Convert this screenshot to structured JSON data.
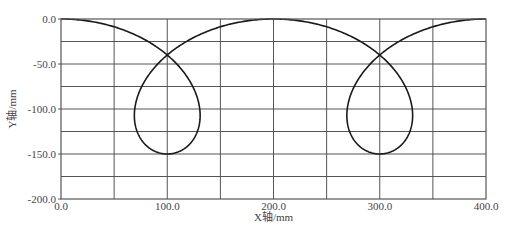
{
  "chart_data": {
    "type": "line",
    "title": "",
    "xlabel": "X轴/mm",
    "ylabel": "Y轴/mm",
    "xlim": [
      0,
      400
    ],
    "ylim": [
      -200,
      0
    ],
    "grid": true,
    "legend": null,
    "x_ticks": [
      0,
      100,
      200,
      300,
      400
    ],
    "x_tick_labels": [
      "0.0",
      "100.0",
      "200.0",
      "300.0",
      "400.0"
    ],
    "x_minor_grid_step": 50,
    "y_ticks": [
      0,
      -50,
      -100,
      -150,
      -200
    ],
    "y_tick_labels": [
      "0.0",
      "-50.0",
      "-100.0",
      "-150.0",
      "-200.0"
    ],
    "y_minor_grid_step": 25,
    "curve_model": {
      "description": "prolate trochoid with two loops",
      "x": "R*t + d*sin(t)",
      "y": "-A*(1 - cos(t))",
      "R": 31.83,
      "d": 74,
      "A": 75,
      "t_range": [
        0,
        12.566
      ]
    },
    "series": [
      {
        "name": "trajectory",
        "color": "#1a1a1a",
        "points": [
          [
            0,
            0
          ],
          [
            50,
            -8.7
          ],
          [
            100,
            -40
          ],
          [
            124,
            -75
          ],
          [
            131,
            -104
          ],
          [
            124,
            -135
          ],
          [
            100,
            -150
          ],
          [
            76,
            -135
          ],
          [
            69,
            -104
          ],
          [
            76,
            -75
          ],
          [
            100,
            -40
          ],
          [
            150,
            -8.7
          ],
          [
            200,
            0
          ],
          [
            250,
            -8.7
          ],
          [
            300,
            -40
          ],
          [
            324,
            -75
          ],
          [
            331,
            -104
          ],
          [
            324,
            -135
          ],
          [
            300,
            -150
          ],
          [
            276,
            -135
          ],
          [
            269,
            -104
          ],
          [
            276,
            -75
          ],
          [
            300,
            -40
          ],
          [
            350,
            -8.7
          ],
          [
            400,
            0
          ]
        ]
      }
    ]
  },
  "plot": {
    "left": 61,
    "top": 19,
    "right": 486,
    "bottom": 199,
    "frame_color": "#555555",
    "grid_color": "#555555",
    "line_color": "#1a1a1a"
  }
}
